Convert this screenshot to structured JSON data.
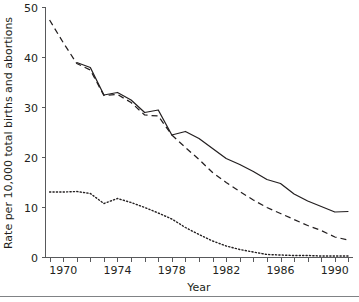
{
  "chart_data": {
    "type": "line",
    "title": "",
    "xlabel": "Year",
    "ylabel": "Rate per 10,000 total births and abortions",
    "xlim": [
      1968.7,
      1991.3
    ],
    "ylim": [
      0,
      50
    ],
    "yticks": [
      0,
      10,
      20,
      30,
      40,
      50
    ],
    "ytick_labels": [
      "0",
      "10",
      "20",
      "30",
      "40",
      "50"
    ],
    "xticks": [
      1969,
      1970,
      1971,
      1972,
      1973,
      1974,
      1975,
      1976,
      1977,
      1978,
      1979,
      1980,
      1981,
      1982,
      1983,
      1984,
      1985,
      1986,
      1987,
      1988,
      1989,
      1990,
      1991
    ],
    "xtick_labels": [
      "1970",
      "1974",
      "1978",
      "1982",
      "1986",
      "1990"
    ],
    "xtick_labeled_values": [
      1970,
      1974,
      1978,
      1982,
      1986,
      1990
    ],
    "grid": false,
    "legend": "none",
    "x": [
      1969,
      1970,
      1971,
      1972,
      1973,
      1974,
      1975,
      1976,
      1977,
      1978,
      1979,
      1980,
      1981,
      1982,
      1983,
      1984,
      1985,
      1986,
      1987,
      1988,
      1989,
      1990,
      1991
    ],
    "series": [
      {
        "name": "solid-series",
        "style": "solid",
        "color": "#231f20",
        "x": [
          1971,
          1972,
          1973,
          1974,
          1975,
          1976,
          1977,
          1978,
          1979,
          1980,
          1981,
          1982,
          1983,
          1984,
          1985,
          1986,
          1987,
          1988,
          1989,
          1990,
          1991
        ],
        "values": [
          39.0,
          38.0,
          32.5,
          33.0,
          31.5,
          29.0,
          29.5,
          24.5,
          25.2,
          23.8,
          21.8,
          19.8,
          18.6,
          17.2,
          15.6,
          14.8,
          12.7,
          11.3,
          10.2,
          9.1,
          9.2
        ]
      },
      {
        "name": "dashed-series",
        "style": "dashed",
        "color": "#231f20",
        "x": [
          1969,
          1970,
          1971,
          1972,
          1973,
          1974,
          1975,
          1976,
          1977,
          1978,
          1979,
          1980,
          1981,
          1982,
          1983,
          1984,
          1985,
          1986,
          1987,
          1988,
          1989,
          1990,
          1991
        ],
        "values": [
          47.5,
          43.0,
          38.8,
          37.5,
          32.4,
          32.6,
          31.0,
          28.5,
          28.3,
          24.5,
          22.0,
          19.6,
          17.0,
          15.0,
          13.2,
          11.5,
          10.0,
          8.8,
          7.6,
          6.4,
          5.4,
          4.1,
          3.5
        ]
      },
      {
        "name": "dotted-series",
        "style": "dotted",
        "color": "#231f20",
        "x": [
          1969,
          1970,
          1971,
          1972,
          1973,
          1974,
          1975,
          1976,
          1977,
          1978,
          1979,
          1980,
          1981,
          1982,
          1983,
          1984,
          1985,
          1986,
          1987,
          1988,
          1989,
          1990,
          1991
        ],
        "values": [
          13.1,
          13.1,
          13.2,
          12.8,
          10.8,
          11.8,
          11.0,
          10.0,
          8.9,
          7.7,
          6.0,
          4.6,
          3.3,
          2.3,
          1.6,
          1.1,
          0.6,
          0.5,
          0.4,
          0.4,
          0.3,
          0.3,
          0.3
        ]
      }
    ]
  },
  "axes": {
    "y_title": "Rate per 10,000 total births and abortions",
    "x_title": "Year"
  }
}
